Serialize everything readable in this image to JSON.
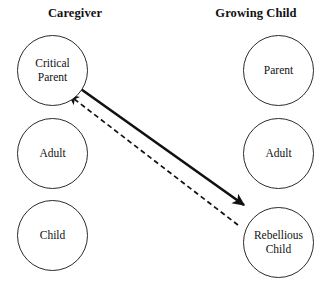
{
  "diagram": {
    "width": 326,
    "height": 284,
    "background_color": "#ffffff",
    "stroke_color": "#2b2b2b",
    "text_color": "#111111"
  },
  "columns": [
    {
      "id": "caregiver",
      "header": "Caregiver",
      "states": [
        {
          "id": "critical-parent",
          "label": "Critical\nParent",
          "x": 17,
          "y": 35
        },
        {
          "id": "caregiver-adult",
          "label": "Adult",
          "x": 17,
          "y": 118
        },
        {
          "id": "caregiver-child",
          "label": "Child",
          "x": 17,
          "y": 200
        }
      ]
    },
    {
      "id": "growing-child",
      "header": "Growing Child",
      "states": [
        {
          "id": "child-parent",
          "label": "Parent",
          "x": 243,
          "y": 35
        },
        {
          "id": "child-adult",
          "label": "Adult",
          "x": 243,
          "y": 118
        },
        {
          "id": "rebellious-child",
          "label": "Rebellious\nChild",
          "x": 243,
          "y": 207
        }
      ]
    }
  ],
  "arrows": [
    {
      "id": "stimulus-arrow",
      "style": "solid",
      "from": "critical-parent",
      "to": "rebellious-child",
      "x1": 78,
      "y1": 87,
      "x2": 244,
      "y2": 205,
      "width": 2.6,
      "color": "#111111",
      "arrowhead_at": "end"
    },
    {
      "id": "response-arrow",
      "style": "dashed",
      "from": "rebellious-child",
      "to": "critical-parent",
      "x1": 238,
      "y1": 225,
      "x2": 69,
      "y2": 95,
      "width": 1.7,
      "color": "#111111",
      "dash_pattern": "5 3.4",
      "arrowhead_at": "end"
    }
  ]
}
